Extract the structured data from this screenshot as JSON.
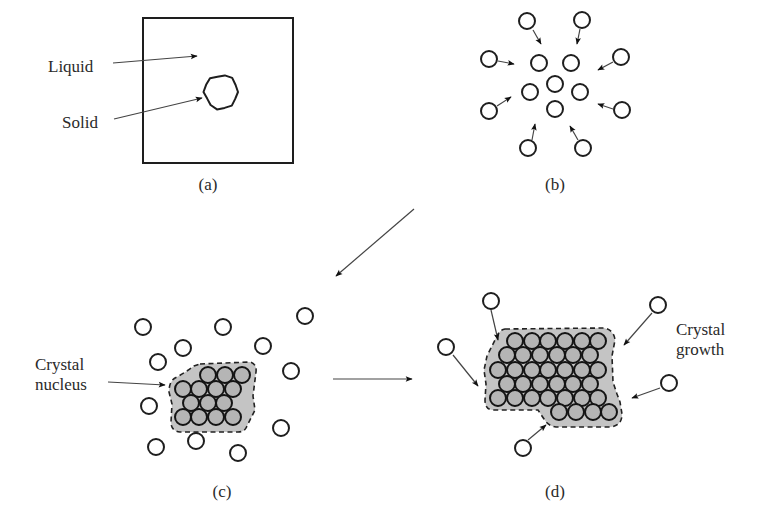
{
  "figure": {
    "panels": {
      "a": {
        "label": "(a)",
        "label_pos": [
          208,
          190
        ],
        "box": {
          "x": 143,
          "y": 18,
          "w": 150,
          "h": 145
        },
        "solid_particle": {
          "cx": 221,
          "cy": 92,
          "r": 17
        },
        "annotations": [
          {
            "text": "Liquid",
            "text_x": 48,
            "text_y": 72,
            "from": [
              113,
              63
            ],
            "to": [
              197,
              56
            ]
          },
          {
            "text": "Solid",
            "text_x": 62,
            "text_y": 128,
            "from": [
              114,
              119
            ],
            "to": [
              202,
              98
            ]
          }
        ]
      },
      "b": {
        "label": "(b)",
        "label_pos": [
          555,
          190
        ],
        "atom_radius": 8,
        "outer_atoms": [
          [
            527,
            21
          ],
          [
            582,
            20
          ],
          [
            489,
            59
          ],
          [
            621,
            57
          ],
          [
            489,
            111
          ],
          [
            622,
            110
          ],
          [
            528,
            148
          ],
          [
            583,
            148
          ]
        ],
        "inner_atoms": [
          [
            539,
            63
          ],
          [
            571,
            63
          ],
          [
            555,
            84
          ],
          [
            530,
            92
          ],
          [
            580,
            92
          ],
          [
            555,
            109
          ]
        ],
        "arrows": [
          {
            "from": [
              533,
              30
            ],
            "to": [
              541,
              44
            ]
          },
          {
            "from": [
              580,
              29
            ],
            "to": [
              577,
              44
            ]
          },
          {
            "from": [
              498,
              61
            ],
            "to": [
              514,
              64
            ]
          },
          {
            "from": [
              613,
              62
            ],
            "to": [
              598,
              70
            ]
          },
          {
            "from": [
              497,
              106
            ],
            "to": [
              511,
              97
            ]
          },
          {
            "from": [
              613,
              109
            ],
            "to": [
              598,
              104
            ]
          },
          {
            "from": [
              532,
              140
            ],
            "to": [
              535,
              124
            ]
          },
          {
            "from": [
              578,
              140
            ],
            "to": [
              570,
              126
            ]
          }
        ]
      },
      "c": {
        "label": "(c)",
        "label_pos": [
          222,
          497
        ],
        "atom_radius": 8,
        "free_atoms": [
          [
            143,
            327
          ],
          [
            223,
            327
          ],
          [
            305,
            316
          ],
          [
            183,
            348
          ],
          [
            263,
            346
          ],
          [
            158,
            362
          ],
          [
            291,
            371
          ],
          [
            149,
            406
          ],
          [
            281,
            428
          ],
          [
            156,
            447
          ],
          [
            196,
            441
          ],
          [
            238,
            453
          ]
        ],
        "cluster_atoms": [
          [
            208,
            375
          ],
          [
            225,
            375
          ],
          [
            242,
            375
          ],
          [
            183,
            389
          ],
          [
            199,
            389
          ],
          [
            216,
            389
          ],
          [
            233,
            389
          ],
          [
            191,
            403
          ],
          [
            208,
            403
          ],
          [
            224,
            403
          ],
          [
            183,
            417
          ],
          [
            199,
            417
          ],
          [
            216,
            417
          ],
          [
            233,
            417
          ]
        ],
        "cluster_outline": "M200,364 L250,362 Q257,364 256,372 L253,396 L255,410 L246,428 Q244,432 238,432 L180,432 Q171,431 171,422 L172,404 L169,392 Q169,380 177,377 Q186,372 194,366 Z",
        "annotation": {
          "text_lines": [
            "Crystal",
            "nucleus"
          ],
          "text_x": 35,
          "text_y": [
            370,
            390
          ],
          "from": [
            108,
            382
          ],
          "to": [
            165,
            385
          ]
        }
      },
      "d": {
        "label": "(d)",
        "label_pos": [
          555,
          497
        ],
        "atom_radius": 8,
        "free_atoms": [
          [
            491,
            301
          ],
          [
            658,
            305
          ],
          [
            446,
            347
          ],
          [
            669,
            383
          ],
          [
            523,
            448
          ]
        ],
        "arrows": [
          {
            "from": [
              491,
              310
            ],
            "to": [
              498,
              340
            ]
          },
          {
            "from": [
              652,
              313
            ],
            "to": [
              624,
              345
            ]
          },
          {
            "from": [
              453,
              355
            ],
            "to": [
              478,
              386
            ]
          },
          {
            "from": [
              660,
              388
            ],
            "to": [
              632,
              398
            ]
          },
          {
            "from": [
              528,
              440
            ],
            "to": [
              546,
              425
            ]
          }
        ],
        "cluster_rows": [
          {
            "y": 341,
            "x": [
              515,
              532,
              548,
              565,
              582,
              598
            ]
          },
          {
            "y": 355,
            "x": [
              507,
              523,
              540,
              557,
              573,
              590
            ]
          },
          {
            "y": 370,
            "x": [
              498,
              515,
              532,
              548,
              565,
              582,
              598
            ]
          },
          {
            "y": 384,
            "x": [
              507,
              523,
              540,
              557,
              573,
              590
            ]
          },
          {
            "y": 398,
            "x": [
              498,
              515,
              532,
              548,
              565,
              582,
              598
            ]
          },
          {
            "y": 412,
            "x": [
              559,
              576,
              593,
              609
            ]
          }
        ],
        "cluster_outline": "M505,329 L604,328 Q614,330 615,340 L612,356 L613,382 L617,394 L620,402 L622,414 Q622,426 610,427 L556,427 Q548,426 544,419 L538,410 L492,410 Q485,409 485,400 L486,384 L484,370 L487,356 L496,338 Q499,330 505,329 Z",
        "annotation": {
          "text_lines": [
            "Crystal",
            "growth"
          ],
          "text_x": 676,
          "text_y": [
            335,
            355
          ]
        }
      }
    },
    "transition_arrows": [
      {
        "from": [
          414,
          209
        ],
        "to": [
          336,
          276
        ]
      },
      {
        "from": [
          333,
          379
        ],
        "to": [
          412,
          379
        ]
      }
    ],
    "colors": {
      "stroke": "#1e1e1e",
      "crystal_fill": "#c4c4c4",
      "atom_in_crystal": "#b5b5b5",
      "background": "#ffffff"
    }
  }
}
